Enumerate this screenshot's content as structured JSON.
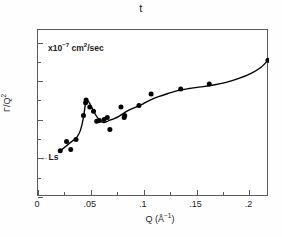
{
  "figure": {
    "title": "t",
    "annotation_units": "x10⁻⁷ cm²/sec",
    "annotation_ls": "←Ls",
    "frame_color": "#5a5a5a",
    "marker_color": "#000000",
    "curve_color": "#000000"
  },
  "chart_data": {
    "type": "scatter",
    "title": "t",
    "xlabel": "Q (Å⁻¹)",
    "ylabel": "Γ/Q²",
    "annotations": [
      {
        "text": "x10⁻⁷ cm²/sec",
        "x": 0.012,
        "y": 8.0
      },
      {
        "text": "←Ls",
        "x": 0.004,
        "y": 2.0
      }
    ],
    "xlim": [
      0,
      0.2185
    ],
    "ylim": [
      0,
      8.65
    ],
    "xticks": [
      0,
      0.05,
      0.1,
      0.15,
      0.2
    ],
    "xticklabels": [
      "0",
      ".05",
      ".1",
      ".15",
      ".2"
    ],
    "xticks_minor": [
      0.025,
      0.075,
      0.125,
      0.175
    ],
    "yticks": [
      0,
      2,
      4,
      6,
      8
    ],
    "yticklabels": [
      "0",
      "2",
      "4",
      "6",
      "8"
    ],
    "yticks_minor": [
      1,
      3,
      5,
      7
    ],
    "grid": false,
    "legend": null,
    "series": [
      {
        "name": "Γ/Q² data",
        "marker": "filled-circle",
        "x": [
          0.021,
          0.027,
          0.031,
          0.036,
          0.043,
          0.045,
          0.0455,
          0.049,
          0.0525,
          0.0555,
          0.058,
          0.0625,
          0.0655,
          0.068,
          0.0785,
          0.0815,
          0.082,
          0.0955,
          0.107,
          0.135,
          0.162,
          0.2175
        ],
        "y": [
          2.4,
          2.88,
          2.46,
          2.98,
          4.22,
          4.88,
          5.02,
          4.66,
          4.44,
          3.93,
          3.96,
          4.02,
          4.12,
          3.5,
          4.66,
          4.12,
          4.22,
          4.74,
          5.34,
          5.6,
          5.85,
          7.08
        ]
      }
    ],
    "fit_curve": {
      "name": "smooth fit",
      "x": [
        0.0205,
        0.024,
        0.028,
        0.032,
        0.0355,
        0.039,
        0.0415,
        0.0435,
        0.0452,
        0.047,
        0.0495,
        0.052,
        0.0545,
        0.0575,
        0.06,
        0.0625,
        0.065,
        0.068,
        0.072,
        0.0765,
        0.081,
        0.086,
        0.092,
        0.0985,
        0.106,
        0.114,
        0.123,
        0.133,
        0.143,
        0.154,
        0.166,
        0.178,
        0.19,
        0.202,
        0.211,
        0.2175
      ],
      "y": [
        2.38,
        2.52,
        2.7,
        2.88,
        3.02,
        3.3,
        3.72,
        4.3,
        4.92,
        5.0,
        4.78,
        4.52,
        4.26,
        4.02,
        3.9,
        3.86,
        3.9,
        3.98,
        4.06,
        4.18,
        4.34,
        4.5,
        4.64,
        4.8,
        5.02,
        5.2,
        5.36,
        5.52,
        5.62,
        5.7,
        5.8,
        5.94,
        6.14,
        6.42,
        6.72,
        7.08
      ]
    }
  }
}
